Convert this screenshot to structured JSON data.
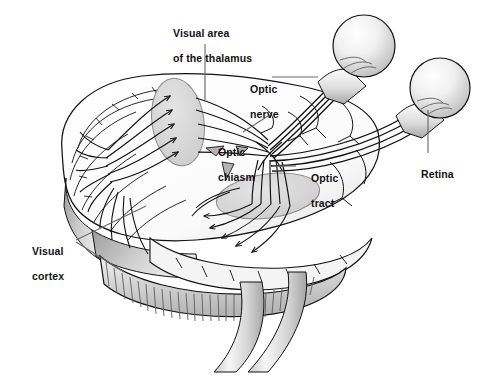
{
  "figure": {
    "kind": "anatomical-illustration",
    "background_color": "#ffffff",
    "ink_color": "#121212",
    "shade_light": "#e8e8e8",
    "shade_mid": "#c9c9c9",
    "shade_dark": "#9a9a9a",
    "leader_color": "#6b6b6b"
  },
  "labels": {
    "thalamus": {
      "line1": "Visual area",
      "line2": "of the thalamus"
    },
    "optic_nerve": {
      "line1": "Optic",
      "line2": "nerve"
    },
    "optic_chiasm": {
      "line1": "Optic",
      "line2": "chiasm"
    },
    "optic_tract": {
      "line1": "Optic",
      "line2": "tract"
    },
    "retina": {
      "line1": "Retina"
    },
    "visual_cortex": {
      "line1": "Visual",
      "line2": "cortex"
    }
  },
  "structures": [
    {
      "name": "cerebral-hemisphere",
      "note": "large gyri-covered lobe occupying center-left"
    },
    {
      "name": "cerebellum",
      "note": "striated band below the hemisphere"
    },
    {
      "name": "brainstem",
      "note": "tapering stalk descending at bottom center"
    },
    {
      "name": "thalamus-ellipse-left",
      "note": "shaded oval where optic fibers synapse"
    },
    {
      "name": "thalamus-ellipse-right",
      "note": "second shaded oval lower right of midline"
    },
    {
      "name": "eyeball-left",
      "note": "shaded sphere upper center-right"
    },
    {
      "name": "eyeball-right",
      "note": "shaded sphere at far right"
    },
    {
      "name": "optic-chiasm",
      "note": "crossing point of the two optic nerves"
    },
    {
      "name": "mammillary-bodies",
      "note": "small triangular grey markings near midline"
    }
  ]
}
